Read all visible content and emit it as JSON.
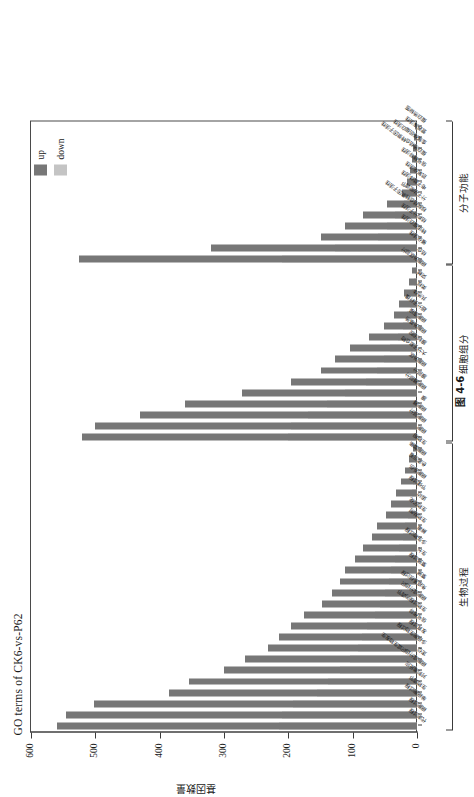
{
  "figure": {
    "caption": "图 4-6",
    "title": "GO terms of CK6-vs-P62",
    "yaxis_title": "基因数量"
  },
  "legend": {
    "position": "top-right",
    "entries": [
      {
        "label": "up",
        "color": "#777777"
      },
      {
        "label": "down",
        "color": "#c4c4c4"
      }
    ]
  },
  "chart_data": {
    "type": "bar",
    "orientation": "vertical-stacked-rotated",
    "title": "GO terms of CK6-vs-P62",
    "xlabel": "",
    "ylabel": "基因数量",
    "ylim": [
      0,
      600
    ],
    "yticks": [
      0,
      100,
      200,
      300,
      400,
      500,
      600
    ],
    "grid": false,
    "legend": [
      "up",
      "down"
    ],
    "groups": [
      {
        "name": "生物过程",
        "label_en": "biological process",
        "start": 0,
        "end": 25
      },
      {
        "name": "细胞组分",
        "label_en": "cellular component",
        "start": 26,
        "end": 41
      },
      {
        "name": "分子功能",
        "label_en": "molecular function",
        "start": 42,
        "end": 54
      }
    ],
    "categories": [
      "代谢过程",
      "细胞过程",
      "单细胞过程",
      "生物调节",
      "对刺激反应",
      "细胞成分组织或生物发生",
      "定位",
      "多细胞生物过程",
      "发育过程",
      "信号传导",
      "生物过程的调节",
      "细胞成分组织",
      "免疫系统过程",
      "繁殖",
      "繁殖过程",
      "生长",
      "多生物过程",
      "解毒",
      "生物粘附",
      "生物矿化",
      "运动",
      "节律过程",
      "细胞杀伤",
      "色素沉着",
      "细胞聚集",
      "生物相",
      "细胞",
      "细胞部分",
      "细胞器",
      "膜",
      "细胞器部分",
      "膜部分",
      "细胞外区",
      "大分子复合物",
      "膜封闭腔",
      "细胞外基质",
      "细胞连接",
      "超分子纤维",
      "共质体",
      "类核",
      "突触",
      "细胞外区部分",
      "结合",
      "催化活性",
      "转运蛋白活性",
      "结构分子活性",
      "核酸结合转录因子活性",
      "分子功能调节",
      "电子载体活性",
      "抗氧化活性",
      "信号转导活性",
      "蛋白质结合转录因子活性",
      "金属伴侣蛋白活性",
      "营养库活性",
      "蛋白质标签"
    ],
    "series": [
      {
        "name": "up",
        "color": "#777777",
        "values": [
          560,
          545,
          502,
          385,
          355,
          300,
          268,
          232,
          215,
          196,
          175,
          148,
          132,
          120,
          112,
          96,
          84,
          70,
          62,
          48,
          40,
          33,
          25,
          18,
          12,
          6,
          520,
          500,
          430,
          360,
          272,
          196,
          150,
          128,
          104,
          74,
          52,
          36,
          28,
          20,
          12,
          8,
          525,
          320,
          150,
          112,
          84,
          46,
          24,
          16,
          11,
          8,
          6,
          4,
          3
        ]
      },
      {
        "name": "down",
        "color": "#c4c4c4",
        "values": [
          215,
          210,
          192,
          155,
          138,
          120,
          104,
          92,
          86,
          78,
          66,
          58,
          50,
          44,
          40,
          34,
          28,
          22,
          18,
          14,
          11,
          8,
          6,
          4,
          3,
          2,
          200,
          196,
          170,
          140,
          112,
          80,
          62,
          52,
          42,
          30,
          22,
          15,
          11,
          8,
          5,
          3,
          210,
          128,
          60,
          46,
          34,
          20,
          12,
          8,
          5,
          4,
          3,
          2,
          2
        ]
      }
    ]
  }
}
